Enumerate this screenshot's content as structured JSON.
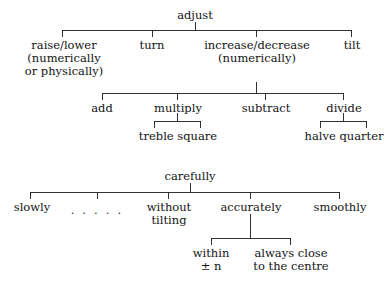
{
  "diagram": {
    "kind": "semantic-feature-tree",
    "stroke_color": "#1c1c1c",
    "text_color": "#141414",
    "background_color": "#ffffff",
    "trees": [
      {
        "name": "adjust-tree",
        "root": "adjust",
        "levels": [
          [
            "raise/lower (numerically or physically)",
            "turn",
            "increase/decrease (numerically)",
            "tilt"
          ],
          [
            "add",
            "multiply",
            "subtract",
            "divide"
          ],
          [
            "treble",
            "square",
            "halve",
            "quarter"
          ]
        ]
      },
      {
        "name": "carefully-tree",
        "root": "carefully",
        "levels": [
          [
            "slowly",
            ".....",
            "without tilting",
            "accurately",
            "smoothly"
          ],
          [
            "within ± n",
            "always close to the centre"
          ]
        ]
      }
    ]
  },
  "nodes": {
    "adjust": {
      "label": "adjust"
    },
    "raise_lower": {
      "line1": "raise/lower",
      "line2": "(numerically",
      "line3": "or physically)"
    },
    "turn": {
      "label": "turn"
    },
    "increase_decrease": {
      "line1": "increase/decrease",
      "line2": "(numerically)"
    },
    "tilt": {
      "label": "tilt"
    },
    "add": {
      "label": "add"
    },
    "multiply": {
      "label": "multiply"
    },
    "subtract": {
      "label": "subtract"
    },
    "divide": {
      "label": "divide"
    },
    "treble_square": {
      "label": "treble square"
    },
    "halve_quarter": {
      "label": "halve quarter"
    },
    "carefully": {
      "label": "carefully"
    },
    "slowly": {
      "label": "slowly"
    },
    "ellipsis": {
      "label": ". . . . ."
    },
    "without_tilting": {
      "line1": "without",
      "line2": "tilting"
    },
    "accurately": {
      "label": "accurately"
    },
    "smoothly": {
      "label": "smoothly"
    },
    "within_n": {
      "line1": "within",
      "line2": "± n"
    },
    "always_close": {
      "line1": "always close",
      "line2": "to the centre"
    }
  }
}
